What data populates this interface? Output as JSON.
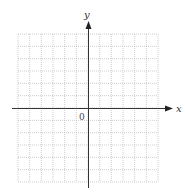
{
  "diagram": {
    "type": "coordinate-grid",
    "x_axis_label": "x",
    "y_axis_label": "y",
    "origin_label": "0",
    "grid": {
      "columns": 12,
      "rows": 12,
      "line_style": "dotted"
    },
    "colors": {
      "grid": "#b8b8b8",
      "axis": "#333333",
      "background": "#ffffff"
    }
  }
}
